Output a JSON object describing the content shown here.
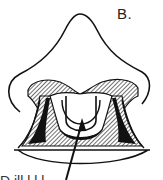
{
  "figure": {
    "panel_label": "B.",
    "caption_partial": "D        ill          l  l  l",
    "colors": {
      "line": "#111111",
      "hatch": "#555555",
      "background": "#ffffff"
    }
  }
}
